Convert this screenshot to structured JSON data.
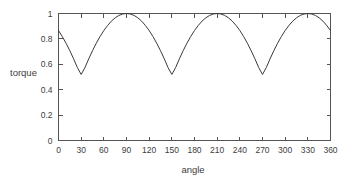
{
  "chart_data": {
    "type": "line",
    "title": "",
    "xlabel": "angle",
    "ylabel": "torque",
    "xlim": [
      0,
      360
    ],
    "ylim": [
      0,
      1
    ],
    "xticks": [
      0,
      30,
      60,
      90,
      120,
      150,
      180,
      210,
      240,
      270,
      300,
      330,
      360
    ],
    "xtick_labels": [
      "0",
      "30",
      "60",
      "90",
      "120",
      "150",
      "180",
      "210",
      "240",
      "270",
      "300",
      "330",
      "360"
    ],
    "yticks": [
      0,
      0.2,
      0.4,
      0.6,
      0.8,
      1
    ],
    "ytick_labels": [
      "0",
      "0.2",
      "0.4",
      "0.6",
      "0.8",
      "1"
    ],
    "grid": false,
    "legend": false,
    "legend_position": "none",
    "series": [
      {
        "name": "torque",
        "color": "#3a3a3a",
        "x": [
          0,
          5,
          10,
          15,
          20,
          25,
          30,
          35,
          40,
          45,
          50,
          55,
          60,
          65,
          70,
          75,
          80,
          85,
          90,
          95,
          100,
          105,
          110,
          115,
          120,
          125,
          130,
          135,
          140,
          145,
          150,
          155,
          160,
          165,
          170,
          175,
          180,
          185,
          190,
          195,
          200,
          205,
          210,
          215,
          220,
          225,
          230,
          235,
          240,
          245,
          250,
          255,
          260,
          265,
          270,
          275,
          280,
          285,
          290,
          295,
          300,
          305,
          310,
          315,
          320,
          325,
          330,
          335,
          340,
          345,
          350,
          355,
          360
        ],
        "y": [
          0.866,
          0.819,
          0.766,
          0.707,
          0.643,
          0.574,
          0.52,
          0.574,
          0.643,
          0.707,
          0.766,
          0.819,
          0.866,
          0.906,
          0.94,
          0.966,
          0.985,
          0.996,
          1.0,
          0.996,
          0.985,
          0.966,
          0.94,
          0.906,
          0.866,
          0.819,
          0.766,
          0.707,
          0.643,
          0.574,
          0.52,
          0.574,
          0.643,
          0.707,
          0.766,
          0.819,
          0.866,
          0.906,
          0.94,
          0.966,
          0.985,
          0.996,
          1.0,
          0.996,
          0.985,
          0.966,
          0.94,
          0.906,
          0.866,
          0.819,
          0.766,
          0.707,
          0.643,
          0.574,
          0.52,
          0.574,
          0.643,
          0.707,
          0.766,
          0.819,
          0.866,
          0.906,
          0.94,
          0.966,
          0.985,
          0.996,
          1.0,
          0.996,
          0.985,
          0.966,
          0.94,
          0.906,
          0.866
        ]
      }
    ],
    "annotations": {
      "period_degrees": 120,
      "minimum_value": 0.52,
      "maximum_value": 1.0,
      "minima_at": [
        30,
        150,
        270
      ],
      "maxima_at": [
        90,
        210,
        330
      ],
      "start_value": 0.866,
      "end_value": 0.866
    }
  }
}
